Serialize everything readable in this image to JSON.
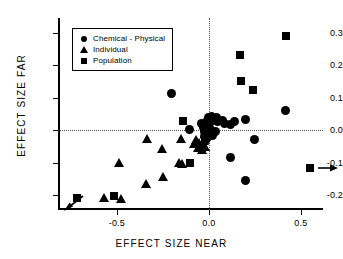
{
  "chart_data": {
    "type": "scatter",
    "title": "",
    "xlabel": "EFFECT  SIZE  NEAR",
    "ylabel": "EFFECT  SIZE  FAR",
    "xlim": [
      -0.82,
      0.62
    ],
    "ylim": [
      -0.245,
      0.345
    ],
    "xticks": [
      -0.5,
      0.0,
      0.5
    ],
    "xticklabels": [
      "-0.5",
      "0.0",
      "0.5"
    ],
    "yticks": [
      0.3,
      0.2,
      0.1,
      0.0,
      -0.1,
      -0.2
    ],
    "yticklabels": [
      "0.3",
      "0.2",
      "0.1",
      "0.0",
      "-0.1",
      "-0.2"
    ],
    "grid": false,
    "reference_lines": [
      {
        "axis": "horizontal",
        "value": 0.0,
        "style": "dotted"
      },
      {
        "axis": "vertical",
        "value": 0.0,
        "style": "dotted"
      }
    ],
    "legend": {
      "position": "upper-left",
      "entries": [
        {
          "label": "Chemical - Physical",
          "marker": "circle"
        },
        {
          "label": "Individual",
          "marker": "triangle"
        },
        {
          "label": "Population",
          "marker": "square"
        }
      ]
    },
    "annotations": [
      {
        "name": "off-scale-arrow-lower-left",
        "direction": "down-left",
        "x": -0.78,
        "y": -0.225
      },
      {
        "name": "off-scale-arrow-right",
        "direction": "right",
        "x": 0.585,
        "y": -0.115
      }
    ],
    "series": [
      {
        "name": "Chemical - Physical",
        "marker": "circle",
        "points": [
          [
            -0.205,
            0.112
          ],
          [
            -0.105,
            0.001
          ],
          [
            -0.04,
            0.02
          ],
          [
            -0.03,
            0.008
          ],
          [
            -0.025,
            -0.004
          ],
          [
            -0.022,
            -0.018
          ],
          [
            -0.018,
            -0.03
          ],
          [
            -0.012,
            -0.012
          ],
          [
            -0.008,
            0.03
          ],
          [
            -0.005,
            -0.022
          ],
          [
            0.0,
            0.04
          ],
          [
            0.005,
            0.01
          ],
          [
            0.008,
            -0.008
          ],
          [
            0.012,
            0.042
          ],
          [
            0.018,
            -0.016
          ],
          [
            0.022,
            0.035
          ],
          [
            0.03,
            0.03
          ],
          [
            0.035,
            -0.005
          ],
          [
            0.042,
            0.038
          ],
          [
            0.048,
            0.028
          ],
          [
            0.072,
            0.03
          ],
          [
            0.085,
            0.022
          ],
          [
            0.12,
            0.018
          ],
          [
            0.14,
            0.028
          ],
          [
            0.2,
            0.032
          ],
          [
            0.118,
            -0.085
          ],
          [
            0.2,
            -0.155
          ],
          [
            0.248,
            -0.027
          ],
          [
            0.418,
            0.06
          ]
        ]
      },
      {
        "name": "Individual",
        "marker": "triangle",
        "points": [
          [
            -0.49,
            -0.1
          ],
          [
            -0.57,
            -0.208
          ],
          [
            -0.478,
            -0.212
          ],
          [
            -0.338,
            -0.026
          ],
          [
            -0.34,
            -0.165
          ],
          [
            -0.255,
            -0.058
          ],
          [
            -0.248,
            -0.145
          ],
          [
            -0.152,
            -0.028
          ],
          [
            -0.16,
            -0.1
          ],
          [
            -0.145,
            -0.105
          ],
          [
            -0.082,
            -0.042
          ],
          [
            -0.07,
            -0.03
          ],
          [
            -0.06,
            -0.055
          ],
          [
            -0.052,
            -0.038
          ],
          [
            -0.04,
            -0.048
          ],
          [
            -0.035,
            -0.062
          ],
          [
            -0.028,
            -0.032
          ],
          [
            -0.022,
            -0.052
          ]
        ]
      },
      {
        "name": "Population",
        "marker": "square",
        "points": [
          [
            -0.718,
            -0.207
          ],
          [
            -0.518,
            -0.202
          ],
          [
            -0.14,
            0.03
          ],
          [
            -0.105,
            -0.102
          ],
          [
            -0.04,
            -0.058
          ],
          [
            0.168,
            0.232
          ],
          [
            0.172,
            0.152
          ],
          [
            0.24,
            0.125
          ],
          [
            0.418,
            0.29
          ],
          [
            0.548,
            -0.115
          ]
        ]
      }
    ]
  }
}
